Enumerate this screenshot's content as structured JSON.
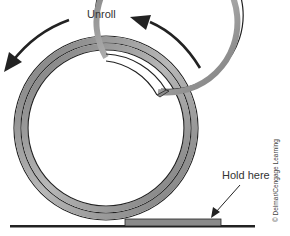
{
  "diagram": {
    "labels": {
      "unroll": "Unroll",
      "hold_here": "Hold here",
      "copyright": "© Delmar/Cengage Learning"
    },
    "coil": {
      "layers": 3,
      "fill_color": "#9a9a9a",
      "edge_color": "#222222"
    },
    "arrows": {
      "direction": "counterclockwise",
      "color": "#222222"
    },
    "ground_color": "#222222"
  }
}
